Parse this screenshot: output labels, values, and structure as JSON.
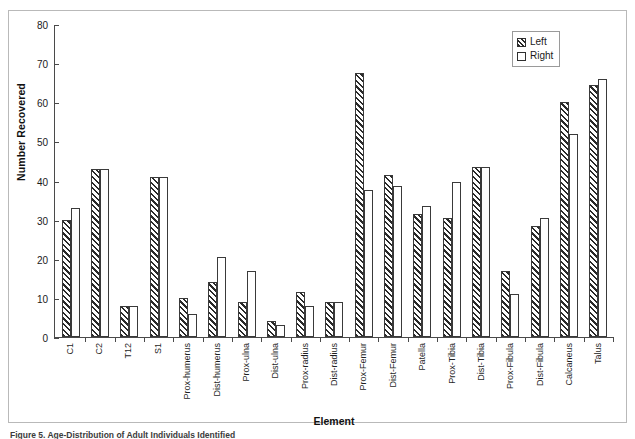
{
  "chart_data": {
    "type": "bar",
    "title": "",
    "xlabel": "Element",
    "ylabel": "Number Recovered",
    "ylim": [
      0,
      80
    ],
    "yticks": [
      0,
      10,
      20,
      30,
      40,
      50,
      60,
      70,
      80
    ],
    "grid": false,
    "legend_position": "top-right",
    "categories": [
      "C1",
      "C2",
      "T12",
      "S1",
      "Prox-humerus",
      "Dist-humerus",
      "Prox-ulna",
      "Dist-ulna",
      "Prox-radius",
      "Dist-radius",
      "Prox-Femur",
      "Dist-Femur",
      "Patella",
      "Prox-Tibia",
      "Dist-Tibia",
      "Prox-Fibula",
      "Dist-Fibula",
      "Calcaneus",
      "Talus"
    ],
    "series": [
      {
        "name": "Left",
        "pattern": "diagonal-hatch",
        "values": [
          30,
          43,
          8,
          41,
          10,
          14,
          9,
          4,
          11.5,
          9,
          67.5,
          41.5,
          31.5,
          30.5,
          43.5,
          17,
          28.5,
          60,
          64.5
        ]
      },
      {
        "name": "Right",
        "pattern": "dotted",
        "values": [
          33,
          43,
          8,
          41,
          6,
          20.5,
          17,
          3,
          8,
          9,
          37.5,
          38.5,
          33.5,
          39.5,
          43.5,
          11,
          30.5,
          52,
          66
        ]
      }
    ]
  },
  "legend": {
    "items": [
      {
        "label": "Left"
      },
      {
        "label": "Right"
      }
    ]
  },
  "caption": {
    "text": "Figure 5. Age-Distribution of Adult Individuals Identified"
  },
  "colors": {
    "axis": "#4a4a4a",
    "frame": "#b9b9b9",
    "bar_outline": "#3a3a3a",
    "hatch": "#2a2a2a",
    "dots": "#8d8d8d",
    "text": "#1a1a1a"
  }
}
